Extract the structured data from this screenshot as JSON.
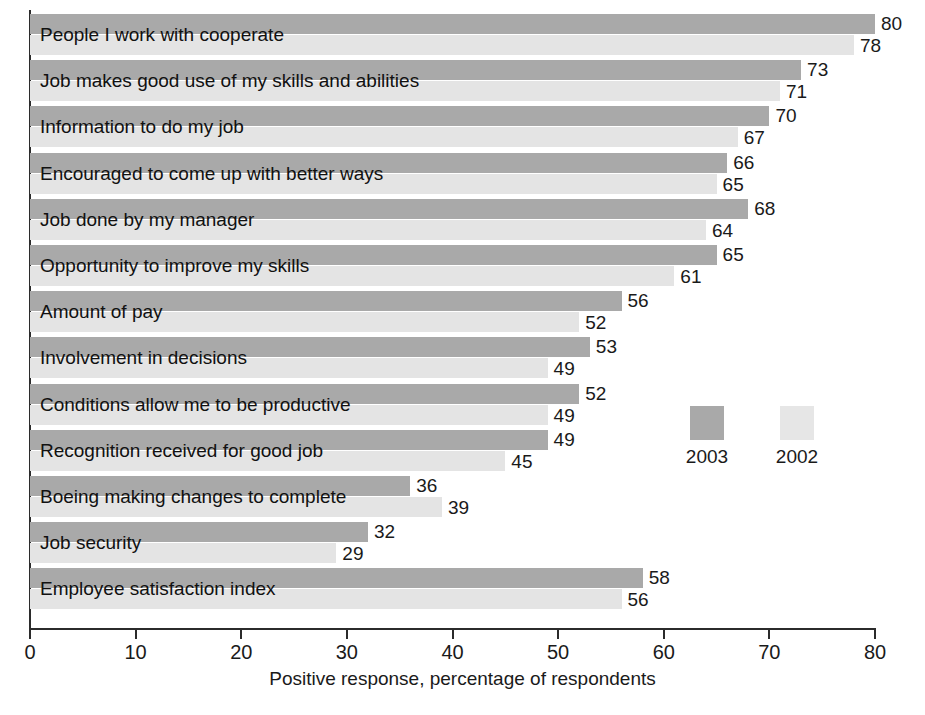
{
  "chart_data": {
    "type": "bar",
    "orientation": "horizontal",
    "title": "",
    "xlabel": "Positive response, percentage of respondents",
    "ylabel": "",
    "xlim": [
      0,
      80
    ],
    "xticks": [
      0,
      10,
      20,
      30,
      40,
      50,
      60,
      70,
      80
    ],
    "grid": false,
    "legend_position": "inside-right",
    "categories": [
      "People I work with cooperate",
      "Job makes good use of my skills and abilities",
      "Information to do my job",
      "Encouraged to come up with better ways",
      "Job done by my manager",
      "Opportunity to improve my skills",
      "Amount of pay",
      "Involvement in decisions",
      "Conditions allow me to be productive",
      "Recognition received for good job",
      "Boeing making changes to complete",
      "Job security",
      "Employee satisfaction index"
    ],
    "series": [
      {
        "name": "2003",
        "color": "#a9a9a9",
        "values": [
          80,
          73,
          70,
          66,
          68,
          65,
          56,
          53,
          52,
          49,
          36,
          32,
          58
        ]
      },
      {
        "name": "2002",
        "color": "#e4e4e4",
        "values": [
          78,
          71,
          67,
          65,
          64,
          61,
          52,
          49,
          49,
          45,
          39,
          29,
          56
        ]
      }
    ]
  },
  "legend": {
    "items": [
      {
        "label": "2003",
        "color": "#a9a9a9"
      },
      {
        "label": "2002",
        "color": "#e4e4e4"
      }
    ]
  },
  "axis": {
    "x_title": "Positive response, percentage of respondents",
    "tick_labels": [
      "0",
      "10",
      "20",
      "30",
      "40",
      "50",
      "60",
      "70",
      "80"
    ]
  },
  "footer": {
    "note": ""
  }
}
